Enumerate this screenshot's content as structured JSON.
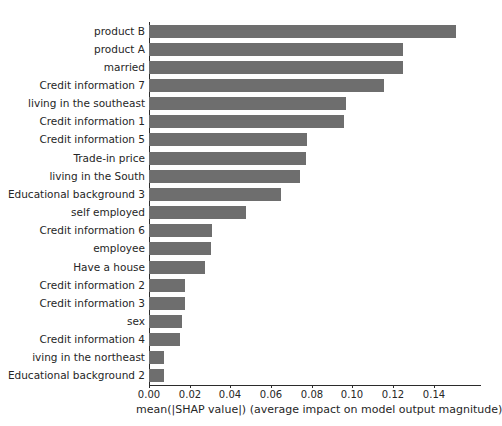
{
  "chart_data": {
    "type": "bar",
    "orientation": "horizontal",
    "title": "",
    "xlabel": "mean(|SHAP value|) (average impact on model output magnitude)",
    "ylabel": "",
    "xlim": [
      0.0,
      0.1632
    ],
    "xticks": [
      0.0,
      0.02,
      0.04,
      0.06,
      0.08,
      0.1,
      0.12,
      0.14
    ],
    "xtick_labels": [
      "0.00",
      "0.02",
      "0.04",
      "0.06",
      "0.08",
      "0.10",
      "0.12",
      "0.14"
    ],
    "grid": false,
    "legend": null,
    "bar_color": "#6e6e6e",
    "background_color": "#ffffff",
    "axis_color": "#2b2b2b",
    "categories": [
      "product B",
      "product A",
      "married",
      "Credit information 7",
      "living in the southeast",
      "Credit information 1",
      "Credit information 5",
      "Trade-in price",
      "living in the South",
      "Educational background 3",
      "self employed",
      "Credit information 6",
      "employee",
      "Have a house",
      "Credit information 2",
      "Credit information 3",
      "sex",
      "Credit information 4",
      "iving in the northeast",
      "Educational background 2"
    ],
    "values": [
      0.151,
      0.125,
      0.125,
      0.1155,
      0.0968,
      0.0958,
      0.0776,
      0.0771,
      0.0742,
      0.0648,
      0.0477,
      0.031,
      0.0305,
      0.0275,
      0.0177,
      0.0177,
      0.0162,
      0.0152,
      0.0074,
      0.0074
    ]
  }
}
